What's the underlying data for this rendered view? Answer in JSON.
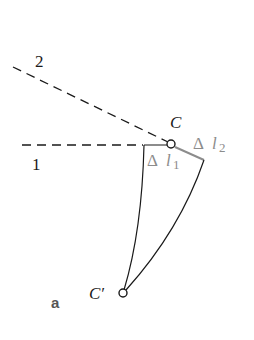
{
  "figure": {
    "panel_label": "a",
    "lines": {
      "line1_label": "1",
      "line2_label": "2"
    },
    "points": {
      "C_label": "C",
      "C_prime_label": "C′"
    },
    "elongations": {
      "dl1_delta": "Δ",
      "dl1_var": "l",
      "dl1_sub": "1",
      "dl2_delta": "Δ",
      "dl2_var": "l",
      "dl2_sub": "2"
    },
    "colors": {
      "ink": "#1a1a1a",
      "gray": "#8c8c8c",
      "panel_label": "#555555"
    }
  }
}
